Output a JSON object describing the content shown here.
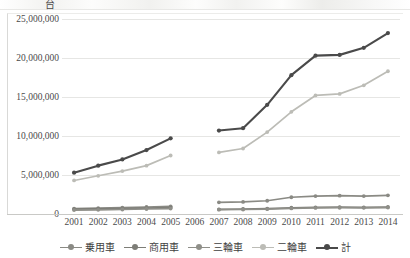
{
  "unit_label": "台",
  "axis": {
    "y_ticks": [
      "0",
      "5,000,000",
      "10,000,000",
      "15,000,000",
      "20,000,000",
      "25,000,000"
    ],
    "x_ticks": [
      "2001",
      "2002",
      "2003",
      "2004",
      "2005",
      "2006",
      "2007",
      "2008",
      "2009",
      "2010",
      "2011",
      "2012",
      "2013",
      "2014"
    ]
  },
  "legend": {
    "items": [
      {
        "label": "乗用車",
        "color": "#8a8a84"
      },
      {
        "label": "商用車",
        "color": "#7d7d77"
      },
      {
        "label": "三輪車",
        "color": "#8f8f89"
      },
      {
        "label": "二輪車",
        "color": "#bcbcb6"
      },
      {
        "label": "計",
        "color": "#4a4a4a"
      }
    ]
  },
  "colors": {
    "passenger": "#8a8a84",
    "commercial": "#7d7d77",
    "three_wheeler": "#8f8f89",
    "two_wheeler": "#bcbcb6",
    "total": "#4a4a4a",
    "gridline": "#e6e6e4",
    "axis": "#c9c9c6",
    "text": "#4a4a4a"
  },
  "chart_data": {
    "type": "line",
    "title": "",
    "xlabel": "",
    "ylabel": "台",
    "ylim": [
      0,
      25000000
    ],
    "grid": true,
    "legend_position": "bottom",
    "x": [
      "2001",
      "2002",
      "2003",
      "2004",
      "2005",
      "2006",
      "2007",
      "2008",
      "2009",
      "2010",
      "2011",
      "2012",
      "2013",
      "2014"
    ],
    "note": "2006 has no data; the lines are drawn as two separate segments (2001-2005 and 2007-2014).",
    "series": [
      {
        "name": "乗用車",
        "color": "#8a8a84",
        "values": [
          700000,
          760000,
          820000,
          900000,
          980000,
          null,
          1500000,
          1550000,
          1700000,
          2150000,
          2300000,
          2350000,
          2300000,
          2400000
        ]
      },
      {
        "name": "商用車",
        "color": "#7d7d77",
        "values": [
          620000,
          660000,
          700000,
          760000,
          820000,
          null,
          600000,
          640000,
          700000,
          800000,
          850000,
          870000,
          860000,
          900000
        ]
      },
      {
        "name": "三輪車",
        "color": "#8f8f89",
        "values": [
          500000,
          540000,
          580000,
          640000,
          700000,
          null,
          550000,
          580000,
          620000,
          720000,
          780000,
          800000,
          790000,
          830000
        ]
      },
      {
        "name": "二輪車",
        "color": "#bcbcb6",
        "values": [
          4300000,
          4900000,
          5500000,
          6200000,
          7500000,
          null,
          7900000,
          8400000,
          10500000,
          13100000,
          15200000,
          15400000,
          16500000,
          18300000
        ]
      },
      {
        "name": "計",
        "color": "#4a4a4a",
        "values": [
          5300000,
          6200000,
          7000000,
          8200000,
          9700000,
          null,
          10700000,
          11000000,
          14000000,
          17800000,
          20300000,
          20400000,
          21300000,
          23200000
        ]
      }
    ]
  }
}
